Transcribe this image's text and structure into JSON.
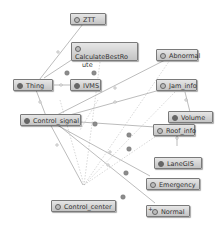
{
  "graph": {
    "nodes": [
      {
        "id": "ztt",
        "label": "ZTT"
      },
      {
        "id": "calc",
        "label": "CalculateBestRoute",
        "line1": "CalculateBestRo",
        "line2": "ute"
      },
      {
        "id": "abnormal",
        "label": "Abnormal"
      },
      {
        "id": "thing",
        "label": "Thing"
      },
      {
        "id": "ivms",
        "label": "IVMS"
      },
      {
        "id": "jam",
        "label": "Jam_info"
      },
      {
        "id": "volume",
        "label": "Volume"
      },
      {
        "id": "control_signal",
        "label": "Control_signal"
      },
      {
        "id": "roof",
        "label": "Roof_info"
      },
      {
        "id": "lanegis",
        "label": "LaneGIS"
      },
      {
        "id": "emergency",
        "label": "Emergency"
      },
      {
        "id": "control_center",
        "label": "Control_center"
      },
      {
        "id": "normal",
        "label": "Normal",
        "badge": "+"
      }
    ],
    "colors": {
      "node_fill_top": "#e6e6e6",
      "node_fill_bottom": "#c4c4c4",
      "node_border": "#7a7a7a",
      "edge_solid": "#8a8a8a",
      "edge_dashed": "#b0b0b0"
    }
  }
}
